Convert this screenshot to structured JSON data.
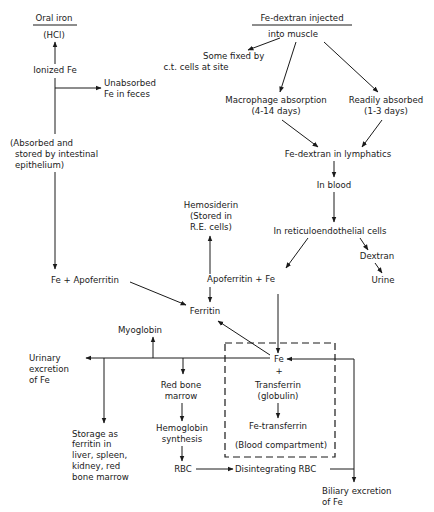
{
  "diagram": {
    "oral": {
      "source": "Oral iron",
      "hcl": "(HCl)",
      "ionized": "Ionized Fe",
      "unabsorbed_1": "Unabsorbed",
      "unabsorbed_2": "Fe in feces",
      "absorbed_1": "(Absorbed and",
      "absorbed_2": "stored by intestinal",
      "absorbed_3": "epithelium)",
      "fe_apoferritin": "Fe + Apoferritin"
    },
    "injected": {
      "source": "Fe-dextran injected",
      "into_muscle": "into muscle",
      "fixed_1": "Some fixed by",
      "fixed_2": "c.t. cells at site",
      "macro_1": "Macrophage absorption",
      "macro_2": "(4-14 days)",
      "ready_1": "Readily absorbed",
      "ready_2": "(1-3 days)",
      "lymph": "Fe-dextran in lymphatics",
      "blood": "In blood",
      "re_cells": "In reticuloendothelial cells",
      "dextran": "Dextran",
      "urine": "Urine"
    },
    "storage": {
      "hemosiderin_1": "Hemosiderin",
      "hemosiderin_2": "(Stored in",
      "hemosiderin_3": "R.E. cells)",
      "apoferritin_fe": "Apoferritin + Fe",
      "ferritin": "Ferritin"
    },
    "distribution": {
      "myoglobin": "Myoglobin",
      "urinary_1": "Urinary",
      "urinary_2": "excretion",
      "urinary_3": "of Fe",
      "marrow_1": "Red bone",
      "marrow_2": "marrow",
      "hemo_1": "Hemoglobin",
      "hemo_2": "synthesis",
      "rbc": "RBC",
      "storage_1": "Storage as",
      "storage_2": "ferritin in",
      "storage_3": "liver, spleen,",
      "storage_4": "kidney, red",
      "storage_5": "bone marrow",
      "disintegrating": "Disintegrating RBC",
      "biliary_1": "Biliary excretion",
      "biliary_2": "of Fe"
    },
    "blood_compartment": {
      "fe": "Fe",
      "plus": "+",
      "transferrin": "Transferrin",
      "globulin": "(globulin)",
      "fe_transferrin": "Fe-transferrin",
      "label": "(Blood compartment)"
    }
  }
}
